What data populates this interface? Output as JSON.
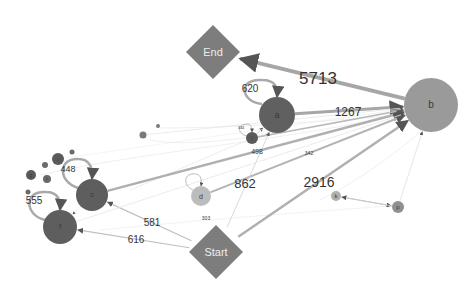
{
  "graph": {
    "colors": {
      "background": "#ffffff",
      "activity_dark": "#5f5f5f",
      "activity_mid": "#8a8a8a",
      "activity_light": "#b5b5b5",
      "terminal": "#808080",
      "edge": "#a8a8a8",
      "edge_faint": "#e6e6e6",
      "label": "#333333"
    },
    "nodes": [
      {
        "id": "End",
        "label": "End",
        "shape": "diamond",
        "x": 213,
        "y": 52,
        "r": 27,
        "fill": "#7d7d7d",
        "font": 11
      },
      {
        "id": "Start",
        "label": "Start",
        "shape": "diamond",
        "x": 216,
        "y": 252,
        "r": 27,
        "fill": "#7d7d7d",
        "font": 11
      },
      {
        "id": "b",
        "label": "b",
        "shape": "circle",
        "x": 431,
        "y": 105,
        "r": 27,
        "fill": "#9a9a9a",
        "font": 10
      },
      {
        "id": "a",
        "label": "a",
        "shape": "circle",
        "x": 277,
        "y": 115,
        "r": 18,
        "fill": "#606060",
        "font": 9
      },
      {
        "id": "c",
        "label": "c",
        "shape": "circle",
        "x": 92,
        "y": 195,
        "r": 16,
        "fill": "#5e5e5e",
        "font": 8
      },
      {
        "id": "f",
        "label": "f",
        "shape": "circle",
        "x": 60,
        "y": 227,
        "r": 17,
        "fill": "#5e5e5e",
        "font": 8
      },
      {
        "id": "d",
        "label": "d",
        "shape": "circle",
        "x": 201,
        "y": 196,
        "r": 10,
        "fill": "#bcbcbc",
        "font": 7
      },
      {
        "id": "t",
        "label": "t",
        "shape": "circle",
        "x": 252,
        "y": 138,
        "r": 6,
        "fill": "#5a5a5a",
        "font": 5
      },
      {
        "id": "k",
        "label": "k",
        "shape": "circle",
        "x": 336,
        "y": 196,
        "r": 5,
        "fill": "#b0b0b0",
        "font": 6
      },
      {
        "id": "p",
        "label": "p",
        "shape": "circle",
        "x": 398,
        "y": 207,
        "r": 6,
        "fill": "#909090",
        "font": 6
      },
      {
        "id": "i",
        "label": "i",
        "shape": "circle",
        "x": 58,
        "y": 159,
        "r": 6,
        "fill": "#5a5a5a",
        "font": 5
      },
      {
        "id": "g",
        "label": "g",
        "shape": "circle",
        "x": 31,
        "y": 175,
        "r": 5,
        "fill": "#5a5a5a",
        "font": 5
      },
      {
        "id": "h",
        "label": "h",
        "shape": "circle",
        "x": 47,
        "y": 179,
        "r": 4,
        "fill": "#6a6a6a",
        "font": 4
      },
      {
        "id": "s1",
        "label": "",
        "shape": "circle",
        "x": 45,
        "y": 165,
        "r": 3,
        "fill": "#6a6a6a",
        "font": 4
      },
      {
        "id": "s2",
        "label": "",
        "shape": "circle",
        "x": 72,
        "y": 152,
        "r": 2.5,
        "fill": "#6a6a6a",
        "font": 4
      },
      {
        "id": "s3",
        "label": "",
        "shape": "circle",
        "x": 28,
        "y": 192,
        "r": 2.5,
        "fill": "#6a6a6a",
        "font": 4
      },
      {
        "id": "s4",
        "label": "",
        "shape": "circle",
        "x": 143,
        "y": 135,
        "r": 3.5,
        "fill": "#7a7a7a",
        "font": 4
      },
      {
        "id": "s5",
        "label": "",
        "shape": "circle",
        "x": 158,
        "y": 126,
        "r": 2,
        "fill": "#7a7a7a",
        "font": 4
      }
    ],
    "edges": [
      {
        "from": "b",
        "to": "End",
        "label": "5713",
        "w": 4,
        "color": "#a6a6a6",
        "lx": 318,
        "ly": 78,
        "font": 17
      },
      {
        "from": "a",
        "to": "b",
        "label": "1267",
        "w": 3,
        "color": "#a6a6a6",
        "lx": 348,
        "ly": 112,
        "font": 12
      },
      {
        "from": "Start",
        "to": "b",
        "label": "2916",
        "w": 2.5,
        "color": "#b0b0b0",
        "lx": 319,
        "ly": 182,
        "font": 14
      },
      {
        "from": "c",
        "to": "b",
        "label": "",
        "w": 2.5,
        "color": "#b0b0b0",
        "lx": 0,
        "ly": 0,
        "font": 0
      },
      {
        "from": "t",
        "to": "b",
        "label": "342",
        "w": 1.6,
        "color": "#b8b8b8",
        "lx": 309,
        "ly": 153,
        "font": 5
      },
      {
        "from": "d",
        "to": "b",
        "label": "862",
        "w": 2,
        "color": "#b4b4b4",
        "lx": 245,
        "ly": 183,
        "font": 13
      },
      {
        "from": "Start",
        "to": "c",
        "label": "581",
        "w": 1.2,
        "color": "#c0c0c0",
        "lx": 152,
        "ly": 223,
        "font": 10
      },
      {
        "from": "Start",
        "to": "f",
        "label": "616",
        "w": 1.2,
        "color": "#c0c0c0",
        "lx": 136,
        "ly": 240,
        "font": 10
      },
      {
        "from": "Start",
        "to": "a",
        "label": "",
        "w": 0.8,
        "color": "#cfcfcf",
        "lx": 0,
        "ly": 0,
        "font": 0
      },
      {
        "from": "t",
        "to": "a",
        "label": "498",
        "w": 0.8,
        "color": "#c8c8c8",
        "lx": 257,
        "ly": 151,
        "font": 7
      },
      {
        "from": "k",
        "to": "p",
        "label": "",
        "w": 1,
        "color": "#c8c8c8",
        "lx": 0,
        "ly": 0,
        "font": 0
      },
      {
        "from": "p",
        "to": "k",
        "label": "",
        "w": 1,
        "color": "#c8c8c8",
        "lx": 0,
        "ly": 0,
        "font": 0
      },
      {
        "from": "p",
        "to": "b",
        "label": "",
        "w": 0.8,
        "color": "#e0e0e0",
        "lx": 0,
        "ly": 0,
        "font": 0
      },
      {
        "from": "f",
        "to": "b",
        "label": "",
        "w": 0.8,
        "color": "#e6e6e6",
        "lx": 0,
        "ly": 0,
        "font": 0
      },
      {
        "from": "s4",
        "to": "b",
        "label": "",
        "w": 0.8,
        "color": "#e6e6e6",
        "lx": 0,
        "ly": 0,
        "font": 0
      },
      {
        "from": "i",
        "to": "b",
        "label": "",
        "w": 0.6,
        "color": "#ececec",
        "lx": 0,
        "ly": 0,
        "font": 0
      },
      {
        "from": "c",
        "to": "f",
        "label": "",
        "w": 0.6,
        "color": "#e6e6e6",
        "lx": 0,
        "ly": 0,
        "font": 0
      }
    ],
    "self_loops": [
      {
        "node": "a",
        "label": "620",
        "lx": 250,
        "ly": 89,
        "font": 10,
        "path": "M 262 104 C 240 102, 238 78, 262 80 C 276 80, 278 88, 277 97",
        "w": 2.5
      },
      {
        "node": "c",
        "label": "448",
        "lx": 68,
        "ly": 169,
        "font": 9,
        "path": "M 78 188 C 58 182, 58 158, 78 159 C 90 159, 93 168, 92 179",
        "w": 2.5
      },
      {
        "node": "f",
        "label": "555",
        "lx": 34,
        "ly": 201,
        "font": 10,
        "path": "M 45 220 C 24 215, 24 190, 46 192 C 58 192, 61 200, 60 210",
        "w": 2.5
      },
      {
        "node": "t",
        "label": "344",
        "lx": 241,
        "ly": 128,
        "font": 4,
        "path": "M 247 136 C 237 134, 237 124, 247 124 C 251 124, 252 128, 252 132",
        "w": 0.8
      },
      {
        "node": "d",
        "label": "303",
        "lx": 206,
        "ly": 218,
        "font": 5,
        "path": "M 193 190 C 182 185, 184 172, 196 174 C 201 175, 202 180, 201 186",
        "w": 0.8
      }
    ]
  }
}
